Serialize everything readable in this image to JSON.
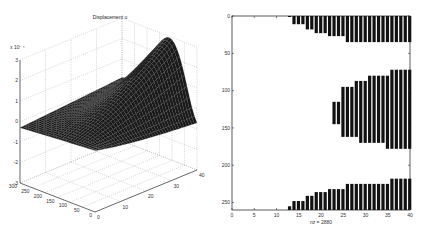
{
  "chart_data": [
    {
      "type": "surface",
      "title": "Displacement u",
      "zlabel_multiplier": "x 10⁻⁴",
      "x_ticks": [
        "0",
        "10",
        "20",
        "30",
        "40"
      ],
      "y_ticks": [
        "0",
        "50",
        "100",
        "150",
        "200",
        "250",
        "300"
      ],
      "z_ticks": [
        "3",
        "2",
        "1",
        "0",
        "-1",
        "-2",
        "-3"
      ],
      "xlim": [
        0,
        40
      ],
      "ylim": [
        0,
        300
      ],
      "zlim": [
        -3,
        3
      ],
      "grid": true,
      "surface_color": "#1a1a1a"
    },
    {
      "type": "heatmap",
      "subtype": "sparsity pattern (spy)",
      "xlabel": "nz = 2880",
      "x_ticks": [
        "0",
        "5",
        "10",
        "15",
        "20",
        "25",
        "30",
        "35",
        "40"
      ],
      "y_ticks": [
        "0",
        "50",
        "100",
        "150",
        "200",
        "250"
      ],
      "xlim": [
        0,
        40
      ],
      "ylim": [
        0,
        260
      ],
      "y_reversed": true,
      "mark_color": "#111111",
      "columns": [
        {
          "x": 13,
          "segments": [
            [
              0,
              1
            ],
            [
              255,
              260
            ]
          ]
        },
        {
          "x": 14,
          "segments": [
            [
              0,
              11
            ],
            [
              248,
              260
            ]
          ]
        },
        {
          "x": 15,
          "segments": [
            [
              0,
              11
            ],
            [
              248,
              260
            ]
          ]
        },
        {
          "x": 16,
          "segments": [
            [
              0,
              11
            ],
            [
              248,
              260
            ]
          ]
        },
        {
          "x": 17,
          "segments": [
            [
              0,
              18
            ],
            [
              241,
              260
            ]
          ]
        },
        {
          "x": 18,
          "segments": [
            [
              0,
              18
            ],
            [
              241,
              260
            ]
          ]
        },
        {
          "x": 19,
          "segments": [
            [
              0,
              23
            ],
            [
              236,
              260
            ]
          ]
        },
        {
          "x": 20,
          "segments": [
            [
              0,
              23
            ],
            [
              236,
              260
            ]
          ]
        },
        {
          "x": 21,
          "segments": [
            [
              0,
              23
            ],
            [
              236,
              260
            ]
          ]
        },
        {
          "x": 22,
          "segments": [
            [
              0,
              27
            ],
            [
              232,
              260
            ]
          ]
        },
        {
          "x": 23,
          "segments": [
            [
              0,
              27
            ],
            [
              115,
              145
            ],
            [
              232,
              260
            ]
          ]
        },
        {
          "x": 24,
          "segments": [
            [
              0,
              27
            ],
            [
              115,
              145
            ],
            [
              232,
              260
            ]
          ]
        },
        {
          "x": 25,
          "segments": [
            [
              0,
              27
            ],
            [
              95,
              162
            ],
            [
              232,
              260
            ]
          ]
        },
        {
          "x": 26,
          "segments": [
            [
              0,
              35
            ],
            [
              95,
              162
            ],
            [
              225,
              260
            ]
          ]
        },
        {
          "x": 27,
          "segments": [
            [
              0,
              35
            ],
            [
              95,
              162
            ],
            [
              225,
              260
            ]
          ]
        },
        {
          "x": 28,
          "segments": [
            [
              0,
              35
            ],
            [
              87,
              162
            ],
            [
              225,
              260
            ]
          ]
        },
        {
          "x": 29,
          "segments": [
            [
              0,
              35
            ],
            [
              87,
              170
            ],
            [
              225,
              260
            ]
          ]
        },
        {
          "x": 30,
          "segments": [
            [
              0,
              35
            ],
            [
              87,
              170
            ],
            [
              225,
              260
            ]
          ]
        },
        {
          "x": 31,
          "segments": [
            [
              0,
              35
            ],
            [
              80,
              170
            ],
            [
              225,
              260
            ]
          ]
        },
        {
          "x": 32,
          "segments": [
            [
              0,
              35
            ],
            [
              80,
              170
            ],
            [
              225,
              260
            ]
          ]
        },
        {
          "x": 33,
          "segments": [
            [
              0,
              35
            ],
            [
              80,
              170
            ],
            [
              225,
              260
            ]
          ]
        },
        {
          "x": 34,
          "segments": [
            [
              0,
              35
            ],
            [
              80,
              170
            ],
            [
              225,
              260
            ]
          ]
        },
        {
          "x": 35,
          "segments": [
            [
              0,
              35
            ],
            [
              80,
              178
            ],
            [
              225,
              260
            ]
          ]
        },
        {
          "x": 36,
          "segments": [
            [
              0,
              35
            ],
            [
              72,
              178
            ],
            [
              218,
              260
            ]
          ]
        },
        {
          "x": 37,
          "segments": [
            [
              0,
              35
            ],
            [
              72,
              178
            ],
            [
              218,
              260
            ]
          ]
        },
        {
          "x": 38,
          "segments": [
            [
              0,
              35
            ],
            [
              72,
              178
            ],
            [
              218,
              260
            ]
          ]
        },
        {
          "x": 39,
          "segments": [
            [
              0,
              35
            ],
            [
              72,
              178
            ],
            [
              218,
              260
            ]
          ]
        },
        {
          "x": 40,
          "segments": [
            [
              0,
              35
            ],
            [
              72,
              178
            ],
            [
              218,
              260
            ]
          ]
        }
      ]
    }
  ]
}
